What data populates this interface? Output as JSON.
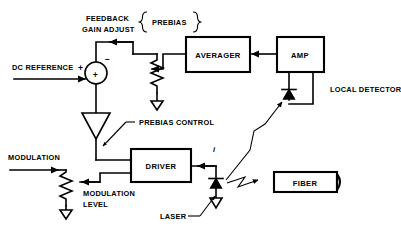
{
  "diagram": {
    "blocks": [
      {
        "id": "averager",
        "label": "AVERAGER"
      },
      {
        "id": "amp",
        "label": "AMP"
      },
      {
        "id": "driver",
        "label": "DRIVER"
      },
      {
        "id": "fiber",
        "label": "FIBER"
      }
    ],
    "labels": {
      "feedback_line1": "FEEDBACK",
      "feedback_line2": "GAIN ADJUST",
      "prebias": "PREBIAS",
      "dc_reference": "DC REFERENCE",
      "prebias_control": "PREBIAS CONTROL",
      "local_detector": "LOCAL DETECTOR",
      "modulation": "MODULATION",
      "modulation_level_line1": "MODULATION",
      "modulation_level_line2": "LEVEL",
      "laser": "LASER",
      "current": "i",
      "plus_sign": "+",
      "minus_sign": "−",
      "summing_plus": "+"
    },
    "colors": {
      "background": "#ffffff",
      "ink": "#000000"
    }
  }
}
